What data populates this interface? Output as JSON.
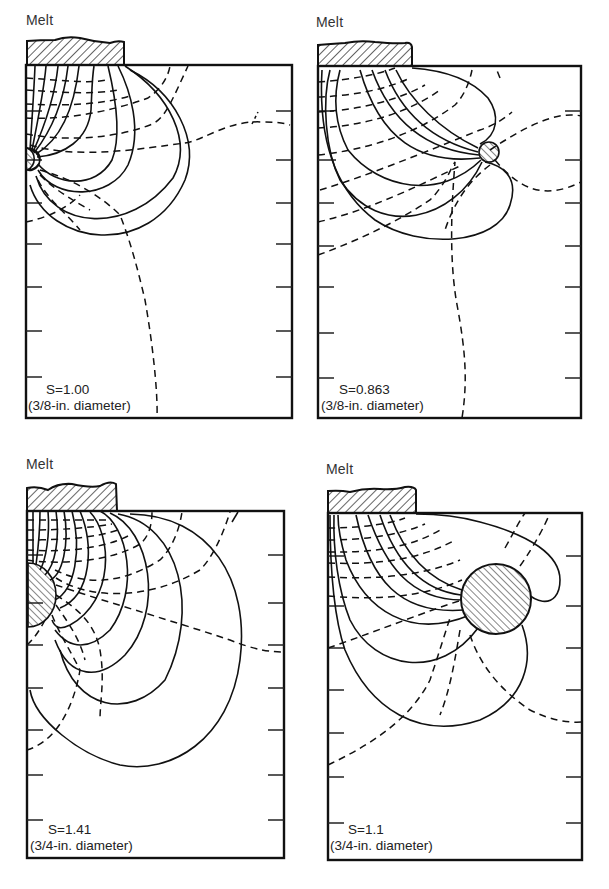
{
  "figure": {
    "panels": [
      {
        "id": "top-left",
        "melt_label": "Melt",
        "s_value": "S=1.00",
        "diameter": "(3/8-in. diameter)",
        "frame": {
          "x": 26,
          "y": 65,
          "w": 266,
          "h": 353
        },
        "melt_block": {
          "x": 27,
          "y": 41,
          "w": 97,
          "h": 24
        },
        "chill": {
          "cx": 30,
          "cy": 159,
          "r": 11,
          "shape": "half-circle-at-wall"
        },
        "left_ticks": [
          111,
          160,
          203,
          244,
          287,
          331,
          377
        ],
        "right_ticks": [
          111,
          160,
          203,
          244,
          287,
          331,
          377
        ],
        "label_pos": {
          "x": 30,
          "y": 381
        }
      },
      {
        "id": "top-right",
        "melt_label": "Melt",
        "s_value": "S=0.863",
        "diameter": "(3/8-in. diameter)",
        "frame": {
          "x": 318,
          "y": 66,
          "w": 263,
          "h": 352
        },
        "melt_block": {
          "x": 318,
          "y": 44,
          "w": 94,
          "h": 22
        },
        "chill": {
          "cx": 489,
          "cy": 152,
          "r": 10,
          "shape": "circle"
        },
        "left_ticks": [
          111,
          160,
          203,
          246,
          287,
          333,
          378
        ],
        "right_ticks": [
          111,
          160,
          203,
          246,
          287,
          333,
          378
        ],
        "label_pos": {
          "x": 322,
          "y": 381
        }
      },
      {
        "id": "bottom-left",
        "melt_label": "Melt",
        "s_value": "S=1.41",
        "diameter": "(3/4-in. diameter)",
        "frame": {
          "x": 27,
          "y": 511,
          "w": 257,
          "h": 347
        },
        "melt_block": {
          "x": 27,
          "y": 486,
          "w": 90,
          "h": 25
        },
        "chill": {
          "cx": 28,
          "cy": 590,
          "r": 28,
          "shape": "half-circle-at-wall"
        },
        "left_ticks": [
          555,
          603,
          645,
          688,
          730,
          775,
          820
        ],
        "right_ticks": [
          555,
          603,
          645,
          688,
          730,
          775,
          820
        ],
        "label_pos": {
          "x": 34,
          "y": 822
        }
      },
      {
        "id": "bottom-right",
        "melt_label": "Melt",
        "s_value": "S=1.1",
        "diameter": "(3/4-in. diameter)",
        "frame": {
          "x": 328,
          "y": 513,
          "w": 254,
          "h": 347
        },
        "melt_block": {
          "x": 328,
          "y": 490,
          "w": 88,
          "h": 23
        },
        "chill": {
          "cx": 496,
          "cy": 599,
          "r": 35,
          "shape": "circle"
        },
        "left_ticks": [
          556,
          606,
          648,
          690,
          733,
          777,
          823
        ],
        "right_ticks": [
          556,
          606,
          648,
          690,
          733,
          777,
          823
        ],
        "label_pos": {
          "x": 330,
          "y": 822
        }
      }
    ],
    "legend": {
      "solid_lines": "isotherms",
      "dashed_lines": "heat-flow lines"
    }
  }
}
